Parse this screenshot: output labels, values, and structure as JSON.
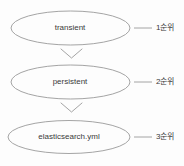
{
  "diagram": {
    "type": "flow",
    "background_color": "#fdfdfd",
    "stroke_color": "#9a9a9a",
    "text_color": "#3a3a3a",
    "nodes": [
      {
        "id": "transient",
        "label": "transient",
        "shape": "ellipse",
        "priority_label": "1순위"
      },
      {
        "id": "persistent",
        "label": "persistent",
        "shape": "ellipse",
        "priority_label": "2순위"
      },
      {
        "id": "elasticsearch-yml",
        "label": "elasticsearch.yml",
        "shape": "ellipse",
        "priority_label": "3순위"
      }
    ],
    "connectors": [
      {
        "from": "transient",
        "to": "persistent",
        "style": "chevron-down"
      },
      {
        "from": "persistent",
        "to": "elasticsearch-yml",
        "style": "chevron-down"
      }
    ],
    "leader_lines": [
      {
        "node": "transient",
        "style": "dash"
      },
      {
        "node": "persistent",
        "style": "dash"
      },
      {
        "node": "elasticsearch-yml",
        "style": "dash"
      }
    ]
  }
}
